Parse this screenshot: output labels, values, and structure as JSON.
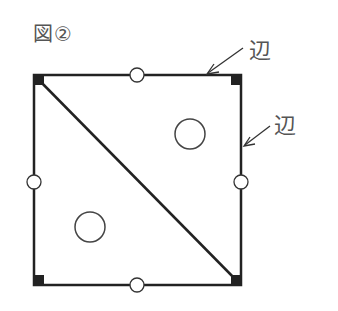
{
  "figure": {
    "title": "図②",
    "labels": {
      "top_edge": "辺",
      "right_edge": "辺"
    }
  },
  "diagram": {
    "shape": "square",
    "square": {
      "x": 34,
      "y": 75,
      "size": 207
    },
    "diagonal": "top-left to bottom-right",
    "corner_marks": [
      "top-left",
      "top-right",
      "bottom-left",
      "bottom-right"
    ],
    "midpoint_ticks": [
      "top",
      "bottom",
      "left",
      "right"
    ],
    "circles": [
      {
        "cx": 90,
        "cy": 227,
        "r": 15,
        "region": "lower-left triangle"
      },
      {
        "cx": 190,
        "cy": 134,
        "r": 15,
        "region": "upper-right triangle"
      }
    ],
    "colors": {
      "stroke": "#222222",
      "label": "#555555"
    }
  }
}
